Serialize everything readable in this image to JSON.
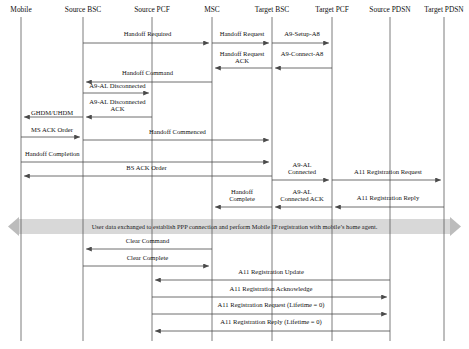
{
  "diagram": {
    "type": "sequence-diagram",
    "title": "",
    "width": 469,
    "height": 349,
    "actors": [
      {
        "id": "mobile",
        "label": "Mobile",
        "x": 21
      },
      {
        "id": "source_bsc",
        "label": "Source BSC",
        "x": 83
      },
      {
        "id": "source_pcf",
        "label": "Source PCF",
        "x": 152
      },
      {
        "id": "msc",
        "label": "MSC",
        "x": 212
      },
      {
        "id": "target_bsc",
        "label": "Target BSC",
        "x": 272
      },
      {
        "id": "target_pcf",
        "label": "Target PCF",
        "x": 332
      },
      {
        "id": "source_pdsn",
        "label": "Source PDSN",
        "x": 390
      },
      {
        "id": "target_pdsn",
        "label": "Target PDSN",
        "x": 444
      }
    ],
    "messages": [
      {
        "label": "Handoff Required",
        "from": "source_bsc",
        "to": "msc",
        "y": 43,
        "label_y": 36,
        "align": "mid"
      },
      {
        "label": "Handoff Request",
        "from": "msc",
        "to": "target_bsc",
        "y": 43,
        "label_y": 36,
        "align": "mid"
      },
      {
        "label": "A9-Setup-A8",
        "from": "target_bsc",
        "to": "target_pcf",
        "y": 43,
        "label_y": 36,
        "align": "mid"
      },
      {
        "label": "Handoff Request\nACK",
        "from": "target_bsc",
        "to": "msc",
        "y": 68,
        "label_y": 56,
        "align": "mid"
      },
      {
        "label": "A9-Connect-A8",
        "from": "target_pcf",
        "to": "target_bsc",
        "y": 68,
        "label_y": 56,
        "align": "mid"
      },
      {
        "label": "Handoff Command",
        "from": "msc",
        "to": "source_bsc",
        "y": 82,
        "label_y": 75,
        "align": "mid"
      },
      {
        "label": "A9-AL Disconnected",
        "from": "source_bsc",
        "to": "source_pcf",
        "y": 93,
        "label_y": 88,
        "align": "mid"
      },
      {
        "label": "A9-AL Disconnected\nACK",
        "from": "source_pcf",
        "to": "source_bsc",
        "y": 117,
        "label_y": 104,
        "align": "mid"
      },
      {
        "label": "GHDM/UHDM",
        "from": "source_bsc",
        "to": "mobile",
        "y": 117,
        "label_y": 115,
        "align": "mid"
      },
      {
        "label": "MS ACK Order",
        "from": "mobile",
        "to": "source_bsc",
        "y": 137,
        "label_y": 132,
        "align": "mid"
      },
      {
        "label": "Handoff Commenced",
        "from": "source_bsc",
        "to": "target_bsc",
        "y": 140,
        "label_y": 134,
        "align": "mid"
      },
      {
        "label": "Handoff Completion",
        "from": "mobile",
        "to": "target_bsc",
        "y": 162,
        "label_y": 156,
        "align": "start"
      },
      {
        "label": "BS ACK Order",
        "from": "target_bsc",
        "to": "mobile",
        "y": 176,
        "label_y": 170,
        "align": "mid"
      },
      {
        "label": "A9-AL\nConnected",
        "from": "target_bsc",
        "to": "target_pcf",
        "y": 180,
        "label_y": 167,
        "align": "mid"
      },
      {
        "label": "A11 Registration Request",
        "from": "target_pcf",
        "to": "target_pdsn",
        "y": 180,
        "label_y": 174,
        "align": "mid"
      },
      {
        "label": "Handoff\nComplete",
        "from": "target_bsc",
        "to": "msc",
        "y": 207,
        "label_y": 194,
        "align": "mid"
      },
      {
        "label": "A9-AL\nConnected ACK",
        "from": "target_pcf",
        "to": "target_bsc",
        "y": 207,
        "label_y": 194,
        "align": "mid"
      },
      {
        "label": "A11 Registration Reply",
        "from": "target_pdsn",
        "to": "target_pcf",
        "y": 207,
        "label_y": 200,
        "align": "mid"
      },
      {
        "label": "Clear Command",
        "from": "msc",
        "to": "source_bsc",
        "y": 249,
        "label_y": 243,
        "align": "mid"
      },
      {
        "label": "Clear Complete",
        "from": "source_bsc",
        "to": "msc",
        "y": 266,
        "label_y": 260,
        "align": "mid"
      },
      {
        "label": "A11 Registration Update",
        "from": "source_pdsn",
        "to": "source_pcf",
        "y": 280,
        "label_y": 274,
        "align": "mid"
      },
      {
        "label": "A11 Registration Acknowledge",
        "from": "source_pcf",
        "to": "source_pdsn",
        "y": 297,
        "label_y": 291,
        "align": "mid"
      },
      {
        "label": "A11 Registration Request (Lifetime = 0)",
        "from": "source_pcf",
        "to": "source_pdsn",
        "y": 314,
        "label_y": 307,
        "align": "mid"
      },
      {
        "label": "A11 Registration Reply (Lifetime = 0)",
        "from": "source_pdsn",
        "to": "source_pcf",
        "y": 331,
        "label_y": 324,
        "align": "mid"
      }
    ],
    "band": {
      "text": "User data exchanged to establish PPP connection and perform Mobile IP registration with mobile’s home agent.",
      "y": 219,
      "height": 15,
      "x_left": 8,
      "x_right": 461,
      "color": "#d8d8d8",
      "arrow_color": "#bcbcbc"
    },
    "colors": {
      "line": "#4a4a4a",
      "lifeline": "#5b5b5b",
      "text": "#111111",
      "band": "#d8d8d8"
    }
  }
}
